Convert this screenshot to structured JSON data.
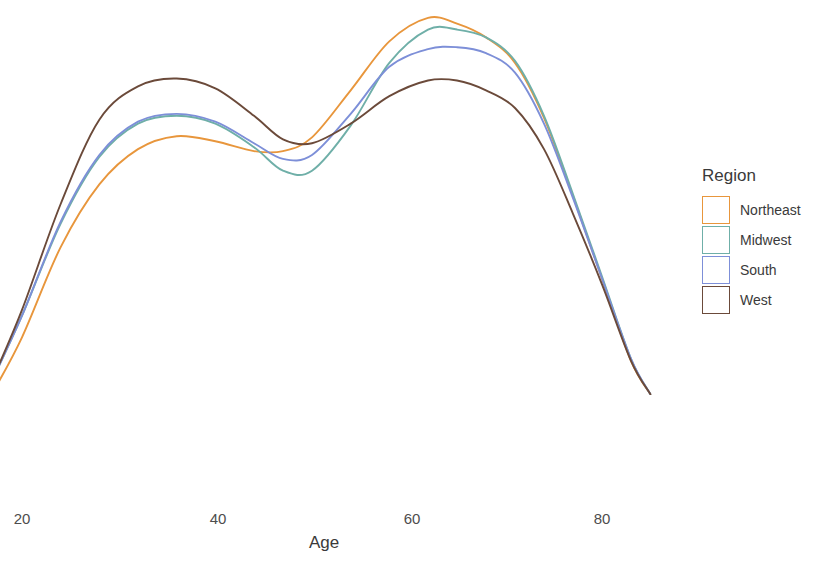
{
  "chart_data": {
    "type": "line",
    "title": "",
    "xlabel": "Age",
    "ylabel": "",
    "xlim": [
      16,
      86
    ],
    "ylim": [
      0,
      1
    ],
    "grid": false,
    "legend_position": "right",
    "legend_title": "Region",
    "x_ticks": [
      {
        "label": "20",
        "value": 20,
        "px": 22
      },
      {
        "label": "40",
        "value": 40,
        "px": 218
      },
      {
        "label": "60",
        "value": 60,
        "px": 412
      },
      {
        "label": "80",
        "value": 80,
        "px": 602
      }
    ],
    "series": [
      {
        "name": "Northeast",
        "color": "#E8963C",
        "x": [
          17,
          20,
          24,
          28,
          32,
          36,
          40,
          44,
          47,
          50,
          54,
          58,
          62,
          65,
          68,
          71,
          74,
          77,
          80,
          83,
          85
        ],
        "values": [
          0.02,
          0.16,
          0.39,
          0.55,
          0.64,
          0.673,
          0.66,
          0.635,
          0.635,
          0.67,
          0.79,
          0.915,
          0.975,
          0.96,
          0.925,
          0.86,
          0.72,
          0.52,
          0.31,
          0.1,
          0.015
        ]
      },
      {
        "name": "Midwest",
        "color": "#6FAFA8",
        "x": [
          17,
          20,
          24,
          28,
          32,
          36,
          40,
          44,
          47,
          50,
          54,
          58,
          62,
          65,
          68,
          71,
          74,
          77,
          80,
          83,
          85
        ],
        "values": [
          0.055,
          0.215,
          0.45,
          0.62,
          0.705,
          0.725,
          0.705,
          0.645,
          0.585,
          0.585,
          0.7,
          0.86,
          0.945,
          0.945,
          0.925,
          0.865,
          0.725,
          0.525,
          0.315,
          0.105,
          0.015
        ]
      },
      {
        "name": "South",
        "color": "#7D8FD8",
        "x": [
          17,
          20,
          24,
          28,
          32,
          36,
          40,
          44,
          47,
          50,
          54,
          58,
          62,
          65,
          68,
          71,
          74,
          77,
          80,
          83,
          85
        ],
        "values": [
          0.055,
          0.215,
          0.455,
          0.625,
          0.71,
          0.73,
          0.71,
          0.655,
          0.615,
          0.625,
          0.73,
          0.85,
          0.895,
          0.9,
          0.885,
          0.835,
          0.705,
          0.515,
          0.31,
          0.105,
          0.015
        ]
      },
      {
        "name": "West",
        "color": "#6B4A3A",
        "x": [
          17,
          20,
          24,
          28,
          32,
          36,
          40,
          44,
          47,
          50,
          54,
          58,
          62,
          65,
          68,
          71,
          74,
          77,
          80,
          83,
          85
        ],
        "values": [
          0.055,
          0.23,
          0.5,
          0.715,
          0.8,
          0.82,
          0.795,
          0.725,
          0.665,
          0.655,
          0.705,
          0.775,
          0.815,
          0.815,
          0.79,
          0.745,
          0.64,
          0.475,
          0.295,
          0.1,
          0.015
        ]
      }
    ]
  },
  "legend": {
    "title": "Region",
    "items": [
      {
        "label": "Northeast",
        "color": "#E8963C"
      },
      {
        "label": "Midwest",
        "color": "#6FAFA8"
      },
      {
        "label": "South",
        "color": "#7D8FD8"
      },
      {
        "label": "West",
        "color": "#6B4A3A"
      }
    ]
  },
  "axis": {
    "x_title": "Age",
    "x_tick_labels": [
      "20",
      "40",
      "60",
      "80"
    ]
  }
}
